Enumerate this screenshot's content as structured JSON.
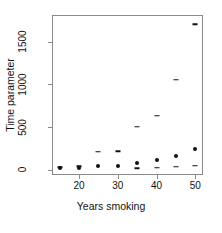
{
  "chart_data": {
    "type": "scatter",
    "title": "",
    "xlabel": "Years smoking",
    "ylabel": "Time parameter",
    "xlim": [
      13,
      52
    ],
    "ylim": [
      -60,
      1810
    ],
    "grid": false,
    "legend": "none",
    "xticks": [
      20,
      30,
      40,
      50
    ],
    "xtick_labels": [
      "20",
      "30",
      "40",
      "50"
    ],
    "yticks": [
      0,
      500,
      1000,
      1500
    ],
    "ytick_labels": [
      "0",
      "500",
      "1000",
      "1500"
    ],
    "x": [
      15,
      20,
      25,
      30,
      35,
      40,
      45,
      50
    ],
    "series": [
      {
        "name": "estimate",
        "marker": "filled-circle",
        "color": "#101010",
        "values": [
          20,
          25,
          40,
          40,
          85,
          115,
          165,
          245
        ]
      },
      {
        "name": "upper",
        "marker": "dash",
        "color": "#101010",
        "values": [
          30,
          45,
          210,
          215,
          505,
          635,
          1055,
          1700
        ]
      },
      {
        "name": "lower",
        "marker": "dash",
        "color": "#101010",
        "values": [
          null,
          null,
          null,
          null,
          20,
          25,
          35,
          50
        ]
      }
    ]
  },
  "axis": {
    "x_title": "Years smoking",
    "y_title": "Time parameter"
  }
}
